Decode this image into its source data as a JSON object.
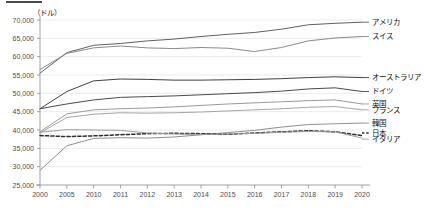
{
  "chart_data": {
    "type": "line",
    "title": "",
    "unit_label": "（ドル）",
    "xlabel": "",
    "ylabel": "",
    "ylim": [
      25000,
      70000
    ],
    "ytick_step": 5000,
    "grid": true,
    "legend_position": "right-inline",
    "categories": [
      "2000",
      "2005",
      "2010",
      "2011",
      "2012",
      "2013",
      "2014",
      "2015",
      "2016",
      "2017",
      "2018",
      "2019",
      "2020"
    ],
    "ytick_labels": [
      "25,000",
      "30,000",
      "35,000",
      "40,000",
      "45,000",
      "50,000",
      "55,000",
      "60,000",
      "65,000",
      "70,000"
    ],
    "series": [
      {
        "name": "アメリカ",
        "color": "#5f5f5f",
        "dashed": false,
        "label_y_value": 69400,
        "values": [
          55500,
          61100,
          63100,
          63600,
          64300,
          64800,
          65500,
          66100,
          66600,
          67500,
          68700,
          69100,
          69400
        ]
      },
      {
        "name": "スイス",
        "color": "#8a8a8a",
        "dashed": false,
        "label_y_value": 65500,
        "values": [
          56500,
          60900,
          62400,
          62900,
          62400,
          62200,
          62500,
          62300,
          61400,
          62500,
          64300,
          65100,
          65500
        ]
      },
      {
        "name": "オーストラリア",
        "color": "#3f3f3f",
        "dashed": false,
        "label_y_value": 54300,
        "values": [
          45800,
          50500,
          53400,
          53900,
          53800,
          53600,
          53600,
          53700,
          53800,
          54000,
          54300,
          54500,
          54300
        ]
      },
      {
        "name": "ドイツ",
        "color": "#4a4a4a",
        "dashed": false,
        "label_y_value": 50500,
        "values": [
          45800,
          47100,
          48200,
          48900,
          49100,
          49300,
          49600,
          49900,
          50200,
          50600,
          51200,
          51500,
          50500
        ]
      },
      {
        "name": "英国",
        "color": "#9a9a9a",
        "dashed": false,
        "label_y_value": 47100,
        "values": [
          39500,
          44400,
          45500,
          45800,
          46000,
          46300,
          46700,
          47100,
          47400,
          47700,
          48000,
          48200,
          47100
        ]
      },
      {
        "name": "フランス",
        "color": "#a5a5a5",
        "dashed": false,
        "label_y_value": 45500,
        "values": [
          39200,
          43400,
          44300,
          44700,
          44600,
          44700,
          44900,
          45200,
          45500,
          45800,
          46200,
          46400,
          45500
        ]
      },
      {
        "name": "韓国",
        "color": "#8f8f8f",
        "dashed": false,
        "label_y_value": 41900,
        "values": [
          29000,
          35700,
          37700,
          37900,
          37800,
          38100,
          38700,
          39300,
          39900,
          40800,
          41500,
          41700,
          41900
        ]
      },
      {
        "name": "日本",
        "color": "#2b2b2b",
        "dashed": true,
        "label_y_value": 39200,
        "values": [
          38500,
          38200,
          38400,
          38700,
          39000,
          39100,
          39000,
          38800,
          39200,
          39500,
          39800,
          39500,
          38500
        ]
      },
      {
        "name": "イタリア",
        "color": "#9d9d9d",
        "dashed": false,
        "label_y_value": 37500,
        "values": [
          39400,
          40100,
          40000,
          39900,
          39200,
          38900,
          38800,
          38900,
          39100,
          39400,
          39600,
          39500,
          37800
        ]
      }
    ]
  }
}
